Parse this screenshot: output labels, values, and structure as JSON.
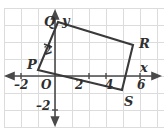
{
  "figure": {
    "type": "coordinate-grid-rectangle",
    "background_color": "#ffffff",
    "grid_color": "#dcdcdc",
    "stroke_color": "#3a3a3a",
    "label_color": "#2e2e2e",
    "grid_spacing_px": 17
  },
  "axes": {
    "x_label": "x",
    "y_label": "y",
    "origin_label": "O",
    "x_ticks": [
      "-2",
      "2",
      "4",
      "6"
    ],
    "x_tick_display": [
      "–2",
      "2",
      "4",
      "6"
    ],
    "y_ticks": [
      "-2"
    ],
    "y_tick_display": [
      "–2"
    ],
    "x_range": [
      -3,
      7
    ],
    "y_range": [
      -3,
      4
    ],
    "arrowheads": [
      "left",
      "right",
      "up",
      "down"
    ]
  },
  "shape": {
    "name": "PQRS",
    "kind": "rectangle",
    "vertices": [
      {
        "label": "Q",
        "x_px": 58,
        "y_px": 22,
        "coord_x": 0.2,
        "coord_y": 3.2
      },
      {
        "label": "R",
        "x_px": 133,
        "y_px": 45,
        "coord_x": 4.6,
        "coord_y": 1.8
      },
      {
        "label": "S",
        "x_px": 122,
        "y_px": 90,
        "coord_x": 3.9,
        "coord_y": -0.8
      },
      {
        "label": "P",
        "x_px": 38,
        "y_px": 70,
        "coord_x": -1.0,
        "coord_y": 0.35
      }
    ],
    "edge_tick_label": "2"
  },
  "labels": {
    "Q": "Q",
    "R": "R",
    "S": "S",
    "P": "P",
    "y": "y",
    "x": "x",
    "O": "O",
    "neg_two_x": "–2",
    "two_x": "2",
    "four_x": "4",
    "six_x": "6",
    "neg_two_y": "–2",
    "edge_two": "2"
  }
}
